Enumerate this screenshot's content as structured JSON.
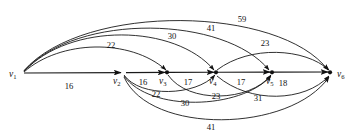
{
  "figure": {
    "background_color": "#ffffff",
    "stroke_color": "#1a1a1a",
    "width": 351,
    "height": 139
  },
  "nodes": [
    {
      "id": "v1",
      "label": "v",
      "subscript": "1",
      "x": 22,
      "y": 73,
      "label_x": 9,
      "label_y": 77,
      "dot": false
    },
    {
      "id": "v2",
      "label": "v",
      "subscript": "2",
      "x": 123,
      "y": 73,
      "label_x": 113,
      "label_y": 84,
      "dot": false
    },
    {
      "id": "v3",
      "label": "v",
      "subscript": "3",
      "x": 167,
      "y": 73,
      "label_x": 159,
      "label_y": 84,
      "dot": true
    },
    {
      "id": "v4",
      "label": "v",
      "subscript": "4",
      "x": 216,
      "y": 73,
      "label_x": 209,
      "label_y": 84,
      "dot": true
    },
    {
      "id": "v5",
      "label": "v",
      "subscript": "5",
      "x": 272,
      "y": 73,
      "label_x": 266,
      "label_y": 84,
      "dot": true
    },
    {
      "id": "v6",
      "label": "v",
      "subscript": "6",
      "x": 330,
      "y": 73,
      "label_x": 337,
      "label_y": 77,
      "dot": true
    }
  ],
  "edges": [
    {
      "id": "e-v1-v2",
      "from": "v1",
      "to": "v2",
      "weight": "16",
      "label_x": 69,
      "label_y": 89,
      "path": "M 24 73 L 121 72.6",
      "arrow": true,
      "kind": "spine"
    },
    {
      "id": "e-v2-v3",
      "from": "v2",
      "to": "v3",
      "weight": "16",
      "label_x": 143,
      "label_y": 85,
      "path": "M 126 72.6 L 165 72.4",
      "arrow": true,
      "kind": "spine"
    },
    {
      "id": "e-v3-v4",
      "from": "v3",
      "to": "v4",
      "weight": "17",
      "label_x": 188,
      "label_y": 85,
      "path": "M 169 72.4 L 214 72.2",
      "arrow": true,
      "kind": "spine"
    },
    {
      "id": "e-v4-v5",
      "from": "v4",
      "to": "v5",
      "weight": "17",
      "label_x": 241,
      "label_y": 85,
      "path": "M 218 72.2 L 270 72.1",
      "arrow": true,
      "kind": "spine"
    },
    {
      "id": "e-v5-v6",
      "from": "v5",
      "to": "v6",
      "weight": "18",
      "label_x": 283,
      "label_y": 86,
      "path": "M 274 72.1 L 328 72",
      "arrow": true,
      "kind": "spine"
    },
    {
      "id": "e-v1-v3",
      "from": "v1",
      "to": "v3",
      "weight": "22",
      "label_x": 111,
      "label_y": 48,
      "path": "M 24 72 C 60 40, 130 38, 166 70",
      "arrow": true,
      "kind": "arc-top"
    },
    {
      "id": "e-v1-v4",
      "from": "v1",
      "to": "v4",
      "weight": "30",
      "label_x": 172,
      "label_y": 39,
      "path": "M 24 71.5 C 70 22, 175 24, 214 70",
      "arrow": true,
      "kind": "arc-top"
    },
    {
      "id": "e-v1-v5",
      "from": "v1",
      "to": "v5",
      "weight": "41",
      "label_x": 211,
      "label_y": 31,
      "path": "M 24 71 C 78 12, 225 16, 269 70",
      "arrow": true,
      "kind": "arc-top"
    },
    {
      "id": "e-v1-v6",
      "from": "v1",
      "to": "v6",
      "weight": "59",
      "label_x": 242,
      "label_y": 22,
      "path": "M 24 70.5 C 85 2, 280 6, 328 70",
      "arrow": true,
      "kind": "arc-top"
    },
    {
      "id": "e-v4-v6",
      "from": "v4",
      "to": "v6",
      "weight": "23",
      "label_x": 265,
      "label_y": 46,
      "path": "M 217 70 C 250 45, 305 48, 329 70",
      "arrow": true,
      "kind": "arc-top"
    },
    {
      "id": "e-v2-v4",
      "from": "v2",
      "to": "v4",
      "weight": "22",
      "label_x": 156,
      "label_y": 97,
      "path": "M 124 75 C 140 98, 196 96, 215 75",
      "arrow": true,
      "kind": "arc-bottom"
    },
    {
      "id": "e-v3-v5",
      "from": "v3",
      "to": "v5",
      "weight": "23",
      "label_x": 216,
      "label_y": 99,
      "path": "M 168 75 C 188 104, 250 102, 271 75",
      "arrow": true,
      "kind": "arc-bottom"
    },
    {
      "id": "e-v2-v5",
      "from": "v2",
      "to": "v5",
      "weight": "30",
      "label_x": 185,
      "label_y": 106,
      "path": "M 124 76 C 150 112, 240 110, 271 76",
      "arrow": true,
      "kind": "arc-bottom"
    },
    {
      "id": "e-v4-v6b",
      "from": "v4",
      "to": "v6",
      "weight": "31",
      "label_x": 258,
      "label_y": 101,
      "path": "M 217 76 C 250 104, 305 102, 329 76",
      "arrow": true,
      "kind": "arc-bottom"
    },
    {
      "id": "e-v2-v6",
      "from": "v2",
      "to": "v6",
      "weight": "41",
      "label_x": 211,
      "label_y": 130,
      "path": "M 124 77 C 150 135, 290 133, 329 77",
      "arrow": true,
      "kind": "arc-bottom"
    }
  ]
}
